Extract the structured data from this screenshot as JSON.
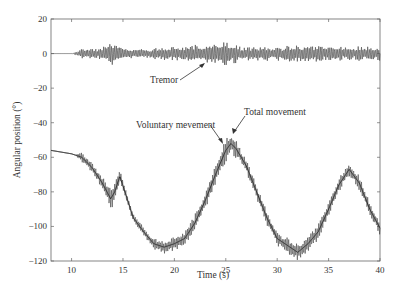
{
  "chart_data": {
    "type": "line",
    "title": "",
    "xlabel": "Time (s)",
    "ylabel": "Angular position (°)",
    "xlim": [
      8,
      40
    ],
    "ylim": [
      -120,
      20
    ],
    "xticks": [
      10,
      15,
      20,
      25,
      30,
      35,
      40
    ],
    "yticks": [
      20,
      0,
      -20,
      -40,
      -60,
      -80,
      -100,
      -120
    ],
    "grid": false,
    "annotations": [
      "Tremor",
      "Voluntary mevement",
      "Total movement"
    ],
    "series": [
      {
        "name": "Tremor",
        "x": [
          8,
          10,
          11,
          12,
          13,
          14,
          15,
          17,
          20,
          23,
          25,
          27,
          30,
          33,
          35,
          37,
          40
        ],
        "amplitude": [
          0,
          0,
          2,
          2,
          3,
          5,
          2,
          2,
          3,
          4,
          5,
          3,
          3,
          4,
          3,
          3,
          3
        ],
        "center": [
          0,
          0,
          0,
          0,
          0,
          0,
          0,
          0,
          0,
          0,
          0,
          0,
          0,
          0,
          0,
          0,
          0
        ]
      },
      {
        "name": "Voluntary movement",
        "x": [
          8,
          9,
          10,
          11,
          12,
          13,
          13.8,
          14.2,
          14.7,
          15.3,
          16,
          17,
          18,
          19,
          20,
          21,
          22,
          23,
          24,
          25,
          25.5,
          26,
          27,
          28,
          29,
          30,
          31,
          32,
          33,
          34,
          35,
          36,
          37,
          38,
          39,
          40
        ],
        "y": [
          -56,
          -57,
          -58,
          -60,
          -66,
          -75,
          -84,
          -80,
          -71,
          -82,
          -95,
          -103,
          -110,
          -112,
          -110,
          -107,
          -98,
          -85,
          -70,
          -56,
          -52,
          -55,
          -65,
          -80,
          -95,
          -107,
          -111,
          -115,
          -110,
          -103,
          -90,
          -76,
          -67,
          -75,
          -90,
          -101
        ]
      },
      {
        "name": "Total movement",
        "description": "Voluntary movement plus tremor oscillation",
        "amplitude": 3
      }
    ]
  }
}
